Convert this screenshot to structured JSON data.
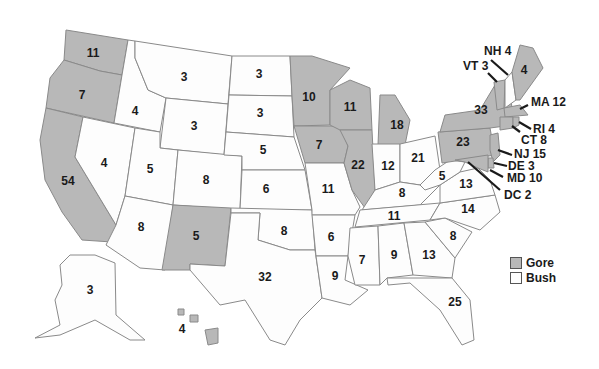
{
  "legend": {
    "items": [
      {
        "label": "Gore",
        "color": "#b8b8b8"
      },
      {
        "label": "Bush",
        "color": "#fdfdfd"
      }
    ]
  },
  "states": {
    "WA": {
      "votes": "11",
      "winner": "Gore"
    },
    "OR": {
      "votes": "7",
      "winner": "Gore"
    },
    "CA": {
      "votes": "54",
      "winner": "Gore"
    },
    "ID": {
      "votes": "4",
      "winner": "Bush"
    },
    "NV": {
      "votes": "4",
      "winner": "Bush"
    },
    "MT": {
      "votes": "3",
      "winner": "Bush"
    },
    "WY": {
      "votes": "3",
      "winner": "Bush"
    },
    "UT": {
      "votes": "5",
      "winner": "Bush"
    },
    "AZ": {
      "votes": "8",
      "winner": "Bush"
    },
    "CO": {
      "votes": "8",
      "winner": "Bush"
    },
    "NM": {
      "votes": "5",
      "winner": "Gore"
    },
    "ND": {
      "votes": "3",
      "winner": "Bush"
    },
    "SD": {
      "votes": "3",
      "winner": "Bush"
    },
    "NE": {
      "votes": "5",
      "winner": "Bush"
    },
    "KS": {
      "votes": "6",
      "winner": "Bush"
    },
    "OK": {
      "votes": "8",
      "winner": "Bush"
    },
    "TX": {
      "votes": "32",
      "winner": "Bush"
    },
    "MN": {
      "votes": "10",
      "winner": "Gore"
    },
    "IA": {
      "votes": "7",
      "winner": "Gore"
    },
    "MO": {
      "votes": "11",
      "winner": "Bush"
    },
    "AR": {
      "votes": "6",
      "winner": "Bush"
    },
    "LA": {
      "votes": "9",
      "winner": "Bush"
    },
    "WI": {
      "votes": "11",
      "winner": "Gore"
    },
    "IL": {
      "votes": "22",
      "winner": "Gore"
    },
    "MI": {
      "votes": "18",
      "winner": "Gore"
    },
    "IN": {
      "votes": "12",
      "winner": "Bush"
    },
    "OH": {
      "votes": "21",
      "winner": "Bush"
    },
    "KY": {
      "votes": "8",
      "winner": "Bush"
    },
    "TN": {
      "votes": "11",
      "winner": "Bush"
    },
    "MS": {
      "votes": "7",
      "winner": "Bush"
    },
    "AL": {
      "votes": "9",
      "winner": "Bush"
    },
    "GA": {
      "votes": "13",
      "winner": "Bush"
    },
    "FL": {
      "votes": "25",
      "winner": "Bush"
    },
    "SC": {
      "votes": "8",
      "winner": "Bush"
    },
    "NC": {
      "votes": "14",
      "winner": "Bush"
    },
    "VA": {
      "votes": "13",
      "winner": "Bush"
    },
    "WV": {
      "votes": "5",
      "winner": "Bush"
    },
    "PA": {
      "votes": "23",
      "winner": "Gore"
    },
    "NY": {
      "votes": "33",
      "winner": "Gore"
    },
    "ME": {
      "votes": "4",
      "winner": "Gore"
    },
    "AK": {
      "votes": "3",
      "winner": "Bush"
    },
    "HI": {
      "votes": "4",
      "winner": "Gore"
    }
  },
  "callouts": {
    "NH": "NH 4",
    "VT": "VT 3",
    "MA": "MA 12",
    "RI": "RI 4",
    "CT": "CT 8",
    "NJ": "NJ 15",
    "DE": "DE 3",
    "MD": "MD 10",
    "DC": "DC 2"
  }
}
